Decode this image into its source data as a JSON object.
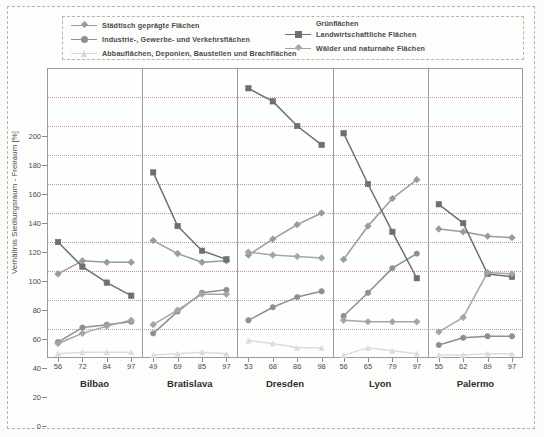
{
  "legend": {
    "left_items": [
      {
        "label": "Städtisch geprägte Flächen",
        "color": "#9a9a9a",
        "marker": "diamond",
        "has_symbol": true
      },
      {
        "label": "Industrie-, Gewerbe- und Verkehrsflächen",
        "color": "#8f8f8f",
        "marker": "circle",
        "has_symbol": true
      },
      {
        "label": "Abbauflächen, Deponien, Baustellen und Brachflächen",
        "color": "#d8d8d8",
        "marker": "triangle",
        "has_symbol": true
      }
    ],
    "right_heading": "Grünflächen",
    "right_items": [
      {
        "label": "Landwirtschaftliche Flächen",
        "color": "#6f6f6f",
        "marker": "square",
        "has_symbol": true
      },
      {
        "label": "Wälder und naturnahe Flächen",
        "color": "#a5a5a5",
        "marker": "diamond",
        "has_symbol": true
      }
    ]
  },
  "chart_data": {
    "type": "line",
    "title": "",
    "xlabel": "",
    "ylabel": "Verhältnis Siedlungsraum - Freiraum [%]",
    "ylim": [
      0,
      200
    ],
    "ytick_step": 20,
    "yticks": [
      0,
      20,
      40,
      60,
      80,
      100,
      120,
      140,
      160,
      180,
      200
    ],
    "grid": true,
    "grid_axis": "y",
    "legend_position": "top",
    "panels": [
      {
        "name": "Bilbao",
        "x": [
          "56",
          "72",
          "84",
          "97"
        ],
        "series": [
          {
            "name": "Städtisch geprägte Flächen",
            "values": [
              58,
              67,
              66,
              66
            ]
          },
          {
            "name": "Industrie-, Gewerbe- und Verkehrsflächen",
            "values": [
              11,
              21,
              23,
              25
            ]
          },
          {
            "name": "Abbauflächen, Deponien, Baustellen und Brachflächen",
            "values": [
              3,
              4,
              4,
              4
            ]
          },
          {
            "name": "Landwirtschaftliche Flächen",
            "values": [
              80,
              63,
              52,
              43
            ]
          },
          {
            "name": "Wälder und naturnahe Flächen",
            "values": [
              10,
              17,
              22,
              26
            ]
          }
        ]
      },
      {
        "name": "Bratislava",
        "x": [
          "49",
          "69",
          "85",
          "97"
        ],
        "series": [
          {
            "name": "Städtisch geprägte Flächen",
            "values": [
              81,
              72,
              66,
              67
            ]
          },
          {
            "name": "Industrie-, Gewerbe- und Verkehrsflächen",
            "values": [
              17,
              32,
              45,
              47
            ]
          },
          {
            "name": "Abbauflächen, Deponien, Baustellen und Brachflächen",
            "values": [
              2,
              3,
              4,
              3
            ]
          },
          {
            "name": "Landwirtschaftliche Flächen",
            "values": [
              128,
              91,
              74,
              68
            ]
          },
          {
            "name": "Wälder und naturnahe Flächen",
            "values": [
              23,
              33,
              44,
              44
            ]
          }
        ]
      },
      {
        "name": "Dresden",
        "x": [
          "53",
          "68",
          "86",
          "98"
        ],
        "series": [
          {
            "name": "Städtisch geprägte Flächen",
            "values": [
              71,
              82,
              92,
              100
            ]
          },
          {
            "name": "Industrie-, Gewerbe- und Verkehrsflächen",
            "values": [
              26,
              35,
              42,
              46
            ]
          },
          {
            "name": "Abbauflächen, Deponien, Baustellen und Brachflächen",
            "values": [
              12,
              10,
              7,
              7
            ]
          },
          {
            "name": "Landwirtschaftliche Flächen",
            "values": [
              186,
              177,
              160,
              147
            ]
          },
          {
            "name": "Wälder und naturnahe Flächen",
            "values": [
              73,
              71,
              70,
              69
            ]
          }
        ]
      },
      {
        "name": "Lyon",
        "x": [
          "56",
          "65",
          "79",
          "97"
        ],
        "series": [
          {
            "name": "Städtisch geprägte Flächen",
            "values": [
              68,
              91,
              110,
              123
            ]
          },
          {
            "name": "Industrie-, Gewerbe- und Verkehrsflächen",
            "values": [
              29,
              45,
              62,
              72
            ]
          },
          {
            "name": "Abbauflächen, Deponien, Baustellen und Brachflächen",
            "values": [
              2,
              7,
              5,
              3
            ]
          },
          {
            "name": "Landwirtschaftliche Flächen",
            "values": [
              155,
              120,
              87,
              55
            ]
          },
          {
            "name": "Wälder und naturnahe Flächen",
            "values": [
              26,
              25,
              25,
              25
            ]
          }
        ]
      },
      {
        "name": "Palermo",
        "x": [
          "55",
          "62",
          "89",
          "97"
        ],
        "series": [
          {
            "name": "Städtisch geprägte Flächen",
            "values": [
              89,
              87,
              84,
              83
            ]
          },
          {
            "name": "Industrie-, Gewerbe- und Verkehrsflächen",
            "values": [
              9,
              14,
              15,
              15
            ]
          },
          {
            "name": "Abbauflächen, Deponien, Baustellen und Brachflächen",
            "values": [
              2,
              2,
              3,
              3
            ]
          },
          {
            "name": "Landwirtschaftliche Flächen",
            "values": [
              106,
              93,
              58,
              56
            ]
          },
          {
            "name": "Wälder und naturnahe Flächen",
            "values": [
              18,
              28,
              59,
              58
            ]
          }
        ]
      }
    ],
    "colors": {
      "staedtisch": "#9a9a9a",
      "industrie": "#8f8f8f",
      "abbau": "#dcdcdc",
      "landwirtschaft": "#6f6f6f",
      "waelder": "#a5a5a5"
    }
  }
}
